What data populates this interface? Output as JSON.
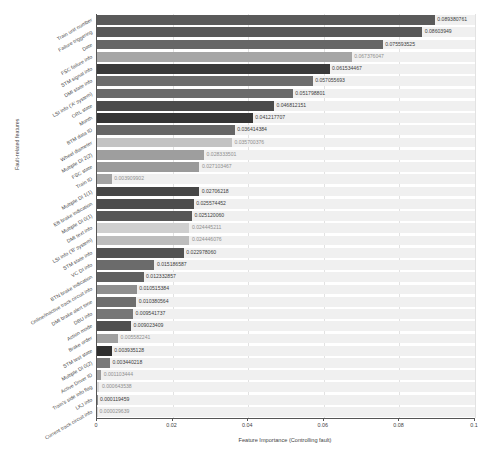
{
  "chart_data": {
    "type": "bar",
    "orientation": "horizontal",
    "title": "",
    "xlabel": "Feature Importance (Controlling fault)",
    "ylabel": "Fault-related features",
    "xlim": [
      0,
      0.1
    ],
    "xticks": [
      "0",
      "0.02",
      "0.04",
      "0.06",
      "0.08",
      "0.1"
    ],
    "xtick_values": [
      0,
      0.02,
      0.04,
      0.06,
      0.08,
      0.1
    ],
    "grid": true,
    "legend": "none",
    "categories": [
      "Train unit number",
      "Failure triggering",
      "Date",
      "FSC failure info",
      "STM signal info",
      "DMI state info",
      "LSI info ('A' system)",
      "ORL state",
      "Month",
      "BTM data ID",
      "Wheel diameter",
      "Multiple DI 2(2)",
      "FSC state",
      "Train ID",
      "Multiple DI 1(1)",
      "EB brake indication",
      "Multiple DI 0(1)",
      "DMI text info",
      "LSI info ('B' system)",
      "STM state info",
      "VC DI info",
      "BTN brake indication",
      "Online/inactive track circuit info",
      "DMI brake alert tone",
      "DBU info",
      "Action mode",
      "Brake order",
      "STM test state",
      "Multiple DI 0(2)",
      "Active Driver ID",
      "Train's side info flag",
      "LKJ info",
      "Current track circuit info"
    ],
    "values": [
      0.089380761,
      0.08603949,
      0.075593525,
      0.067376047,
      0.061534467,
      0.057055693,
      0.051798801,
      0.046812151,
      0.041217707,
      0.036414384,
      0.035700376,
      0.028333501,
      0.027103467,
      0.003909902,
      0.02706218,
      0.025574452,
      0.02512006,
      0.024445211,
      0.024446076,
      0.02297806,
      0.015186587,
      0.012332857,
      0.010515384,
      0.010380564,
      0.009541737,
      0.009023409,
      0.005582241,
      0.003935128,
      0.003440218,
      0.001103444,
      0.000643538,
      0.000119459,
      2.9639e-05
    ],
    "value_labels": [
      "0.089380761",
      "0.08603949",
      "0.075593525",
      "0.067376047",
      "0.061534467",
      "0.057055693",
      "0.051798801",
      "0.046812151",
      "0.041217707",
      "0.036414384",
      "0.035700376",
      "0.028333501",
      "0.027103467",
      "0.003909902",
      "0.02706218",
      "0.025574452",
      "0.025120060",
      "0.024445211",
      "0.024446076",
      "0.022978060",
      "0.015186587",
      "0.012332857",
      "0.010515384",
      "0.010380564",
      "0.009541737",
      "0.009023409",
      "0.005582241",
      "0.003935128",
      "0.003440218",
      "0.001103444",
      "0.000643538",
      "0.000119459",
      "0.000029639"
    ],
    "bar_colors": [
      "#5a5a5a",
      "#585858",
      "#666666",
      "#a6a6a6",
      "#3a3a3a",
      "#6d6d6d",
      "#6a6a6a",
      "#4b4b4b",
      "#353535",
      "#666666",
      "#c3c3c3",
      "#9e9e9e",
      "#9a9a9a",
      "#a3a3a3",
      "#464646",
      "#4d4d4d",
      "#575757",
      "#cfcfcf",
      "#bdbdbd",
      "#525252",
      "#6b6b6b",
      "#606060",
      "#8f8f8f",
      "#6e6e6e",
      "#777777",
      "#4f4f4f",
      "#a0a0a0",
      "#2f2f2f",
      "#7a7a7a",
      "#9c9c9c",
      "#d6d6d6",
      "#8c8c8c",
      "#d0d0d0"
    ],
    "track_color": "#f0f0f0",
    "axis_color": "#555555",
    "grid_color": "#e2e2e2"
  }
}
